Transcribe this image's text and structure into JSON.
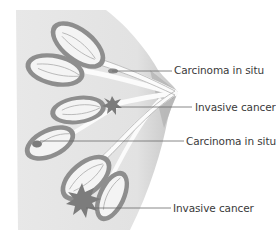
{
  "diagram": {
    "colors": {
      "tissue": "#e6e6e6",
      "tissue_shadow": "#b8b8b8",
      "lobule_outer": "#8e8e8e",
      "lobule_inner": "#f4f4f4",
      "duct": "#fafafa",
      "tumor": "#7c7c7c",
      "leader_line": "#6a6a6a",
      "text": "#3a3a3a"
    },
    "labels": [
      {
        "id": "label-1",
        "text": "Carcinoma in situ",
        "x": 174,
        "y": 64
      },
      {
        "id": "label-2",
        "text": "Invasive cancer",
        "x": 195,
        "y": 101
      },
      {
        "id": "label-3",
        "text": "Carcinoma in situ",
        "x": 186,
        "y": 135
      },
      {
        "id": "label-4",
        "text": "Invasive cancer",
        "x": 173,
        "y": 202
      }
    ]
  }
}
